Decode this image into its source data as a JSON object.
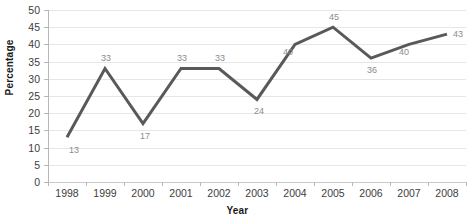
{
  "chart_data": {
    "type": "line",
    "title": "",
    "xlabel": "Year",
    "ylabel": "Percentage",
    "categories": [
      "1998",
      "1999",
      "2000",
      "2001",
      "2002",
      "2003",
      "2004",
      "2005",
      "2006",
      "2007",
      "2008"
    ],
    "values": [
      13,
      33,
      17,
      33,
      33,
      24,
      40,
      45,
      36,
      40,
      43
    ],
    "data_labels": [
      "13",
      "33",
      "17",
      "33",
      "33",
      "24",
      "40",
      "45",
      "36",
      "40",
      "43"
    ],
    "ylim": [
      0,
      50
    ],
    "ytick_step": 5,
    "yticks": [
      "0",
      "5",
      "10",
      "15",
      "20",
      "25",
      "30",
      "35",
      "40",
      "45",
      "50"
    ],
    "grid": "horizontal",
    "legend": "none",
    "series": [
      {
        "name": "Percentage",
        "values": [
          13,
          33,
          17,
          33,
          33,
          24,
          40,
          45,
          36,
          40,
          43
        ],
        "color": "#595959"
      }
    ]
  },
  "colors": {
    "line": "#595959",
    "gridline": "#e6e6e6",
    "axis": "#b7b7b7",
    "tick_text": "#3d3d3d",
    "data_label_text": "#8c8c8c",
    "background": "#ffffff"
  },
  "label_offsets": [
    {
      "dx": 2,
      "dy": 9
    },
    {
      "dx": -4,
      "dy": -14
    },
    {
      "dx": -3,
      "dy": 8
    },
    {
      "dx": -4,
      "dy": -14
    },
    {
      "dx": -4,
      "dy": -14
    },
    {
      "dx": -3,
      "dy": 8
    },
    {
      "dx": -12,
      "dy": 4
    },
    {
      "dx": -4,
      "dy": -14
    },
    {
      "dx": -4,
      "dy": 8
    },
    {
      "dx": -10,
      "dy": 4
    },
    {
      "dx": 6,
      "dy": -4
    }
  ]
}
